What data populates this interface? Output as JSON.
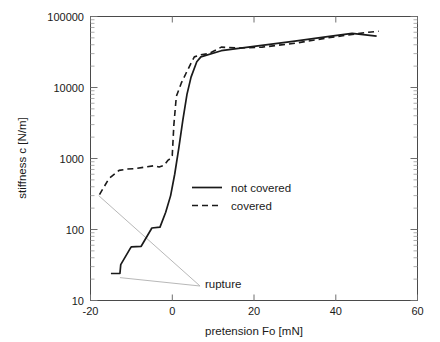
{
  "chart_data": {
    "type": "line",
    "title": "",
    "xlabel": "pretension Fo [mN]",
    "ylabel": "stiffness c [N/m]",
    "xlim": [
      -20,
      60
    ],
    "ylim": [
      10,
      100000
    ],
    "yscale": "log",
    "xscale": "linear",
    "grid": false,
    "xticks": [
      "-20",
      "0",
      "20",
      "40",
      "60"
    ],
    "xtick_values": [
      -20,
      0,
      20,
      40,
      60
    ],
    "yticks": [
      "10",
      "100",
      "1000",
      "10000",
      "100000"
    ],
    "ytick_values": [
      10,
      100,
      1000,
      10000,
      100000
    ],
    "legend_position": "center",
    "series": [
      {
        "name": "not covered",
        "style": "solid",
        "color": "#1a1a1a",
        "x": [
          -15.0,
          -12.8,
          -12.6,
          -10.2,
          -10.0,
          -7.6,
          -5.2,
          -5.0,
          -3.0,
          -1.6,
          -0.4,
          0.6,
          1.6,
          2.6,
          3.6,
          4.6,
          6.0,
          7.0,
          12.0,
          20.0,
          30.0,
          38.0,
          44.0,
          50.0
        ],
        "y": [
          24.0,
          24.0,
          32.0,
          55.0,
          57.0,
          58.0,
          100.0,
          105.0,
          108.0,
          175.0,
          300.0,
          600.0,
          1400.0,
          3500.0,
          8000.0,
          14000.0,
          23000.0,
          27000.0,
          33000.0,
          38000.0,
          45000.0,
          52000.0,
          58000.0,
          53000.0
        ]
      },
      {
        "name": "covered",
        "style": "dashed",
        "color": "#1a1a1a",
        "x": [
          -17.8,
          -15.5,
          -13.0,
          -11.0,
          -9.0,
          -6.5,
          -4.5,
          -3.2,
          -2.0,
          -1.0,
          -0.4,
          0.0,
          0.4,
          1.0,
          2.2,
          3.4,
          4.6,
          5.4,
          7.0,
          9.0,
          12.0,
          16.0,
          22.0,
          30.0,
          38.0,
          44.0,
          48.0,
          50.5
        ],
        "y": [
          310.0,
          520.0,
          680.0,
          710.0,
          720.0,
          760.0,
          790.0,
          760.0,
          800.0,
          950.0,
          1000.0,
          1100.0,
          3000.0,
          7500.0,
          11500.0,
          16000.0,
          22000.0,
          27000.0,
          29000.0,
          30000.0,
          37000.0,
          36000.0,
          37000.0,
          42000.0,
          50000.0,
          56000.0,
          60000.0,
          62000.0
        ]
      }
    ],
    "annotations": [
      {
        "text": "rupture",
        "x": 8.0,
        "y": 17.0,
        "leader_lines": [
          {
            "from": [
              -18.0,
              300.0
            ],
            "to": [
              6.8,
              16.0
            ]
          },
          {
            "from": [
              -12.8,
              21.0
            ],
            "to": [
              6.8,
              16.0
            ]
          }
        ]
      }
    ],
    "legend_entries": [
      {
        "label": "not covered",
        "style": "solid"
      },
      {
        "label": "covered",
        "style": "dashed"
      }
    ]
  }
}
